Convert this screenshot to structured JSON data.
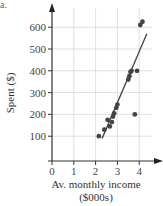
{
  "part_label": "a.",
  "chart_data": {
    "type": "scatter",
    "title": "",
    "xlabel": "Av. monthly income",
    "xlabel_unit": "($000s)",
    "ylabel": "Spent ($)",
    "xlim": [
      0,
      4.6
    ],
    "ylim": [
      0,
      680
    ],
    "xticks": [
      0,
      1,
      2,
      3,
      4
    ],
    "yticks": [
      100,
      200,
      300,
      400,
      500,
      600
    ],
    "grid": true,
    "legend": null,
    "series": [
      {
        "name": "observations",
        "type": "scatter",
        "points": [
          {
            "x": 2.15,
            "y": 100
          },
          {
            "x": 2.4,
            "y": 130
          },
          {
            "x": 2.55,
            "y": 175
          },
          {
            "x": 2.65,
            "y": 145
          },
          {
            "x": 2.75,
            "y": 165
          },
          {
            "x": 2.8,
            "y": 190
          },
          {
            "x": 2.85,
            "y": 205
          },
          {
            "x": 2.95,
            "y": 230
          },
          {
            "x": 3.0,
            "y": 245
          },
          {
            "x": 3.5,
            "y": 360
          },
          {
            "x": 3.55,
            "y": 375
          },
          {
            "x": 3.6,
            "y": 395
          },
          {
            "x": 3.65,
            "y": 400
          },
          {
            "x": 3.8,
            "y": 200
          },
          {
            "x": 3.9,
            "y": 400
          },
          {
            "x": 4.05,
            "y": 610
          },
          {
            "x": 4.15,
            "y": 625
          }
        ]
      },
      {
        "name": "regression line",
        "type": "line",
        "points": [
          {
            "x": 2.3,
            "y": 90
          },
          {
            "x": 4.35,
            "y": 570
          }
        ]
      }
    ],
    "colors": {
      "axis": "#333333",
      "grid": "#d8d8d8",
      "points": "#444444",
      "line": "#444444"
    }
  }
}
